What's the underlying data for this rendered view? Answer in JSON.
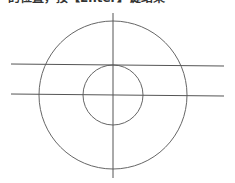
{
  "caption": {
    "text": "的位置，按【Enter】键结束"
  },
  "drawing": {
    "stroke_color": "#555555",
    "background": "#ffffff",
    "large_circle": {
      "cx": 113,
      "cy": 95,
      "r": 74
    },
    "small_circle": {
      "cx": 113,
      "cy": 95,
      "r": 30
    },
    "vertical_line": {
      "x1": 113,
      "y1": 13,
      "x2": 113,
      "y2": 178
    },
    "horizontal_lines": [
      {
        "x1": 11,
        "y1": 64,
        "x2": 224,
        "y2": 66
      },
      {
        "x1": 11,
        "y1": 94,
        "x2": 224,
        "y2": 96
      }
    ]
  }
}
